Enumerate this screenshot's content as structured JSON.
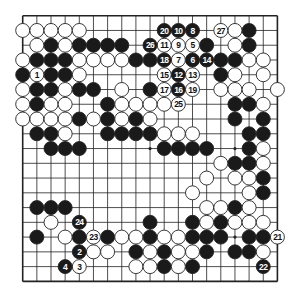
{
  "diagram": {
    "type": "go-board",
    "size": 19,
    "colors": {
      "black": "#1a1a1a",
      "white": "#ffffff",
      "line": "#222222",
      "background": "#ffffff"
    },
    "geometry": {
      "left": 22.7,
      "top": 15.7,
      "dx": 14.15,
      "dy": 14.76,
      "stone_r": 7.0
    },
    "star_points": [
      [
        3,
        3
      ],
      [
        3,
        9
      ],
      [
        3,
        15
      ],
      [
        9,
        3
      ],
      [
        9,
        9
      ],
      [
        9,
        15
      ],
      [
        15,
        3
      ],
      [
        15,
        9
      ],
      [
        15,
        15
      ]
    ],
    "stones": {
      "black": [
        [
          1,
          16
        ],
        [
          2,
          2
        ],
        [
          2,
          4
        ],
        [
          2,
          5
        ],
        [
          2,
          6
        ],
        [
          2,
          7
        ],
        [
          2,
          13
        ],
        [
          2,
          16
        ],
        [
          3,
          1
        ],
        [
          3,
          2
        ],
        [
          3,
          3
        ],
        [
          3,
          8
        ],
        [
          3,
          9
        ],
        [
          3,
          14
        ],
        [
          3,
          15
        ],
        [
          4,
          0
        ],
        [
          4,
          2
        ],
        [
          4,
          3
        ],
        [
          4,
          14
        ],
        [
          5,
          1
        ],
        [
          5,
          2
        ],
        [
          5,
          4
        ],
        [
          5,
          5
        ],
        [
          5,
          9
        ],
        [
          6,
          1
        ],
        [
          6,
          6
        ],
        [
          6,
          15
        ],
        [
          6,
          16
        ],
        [
          7,
          4
        ],
        [
          7,
          6
        ],
        [
          7,
          8
        ],
        [
          7,
          15
        ],
        [
          7,
          17
        ],
        [
          8,
          1
        ],
        [
          8,
          2
        ],
        [
          8,
          6
        ],
        [
          8,
          7
        ],
        [
          8,
          8
        ],
        [
          8,
          9
        ],
        [
          8,
          16
        ],
        [
          8,
          17
        ],
        [
          9,
          2
        ],
        [
          9,
          3
        ],
        [
          9,
          4
        ],
        [
          9,
          10
        ],
        [
          9,
          11
        ],
        [
          9,
          12
        ],
        [
          9,
          13
        ],
        [
          9,
          16
        ],
        [
          10,
          15
        ],
        [
          10,
          16
        ],
        [
          11,
          17
        ],
        [
          12,
          17
        ],
        [
          13,
          1
        ],
        [
          13,
          2
        ],
        [
          13,
          3
        ],
        [
          13,
          15
        ],
        [
          14,
          9
        ],
        [
          14,
          12
        ],
        [
          14,
          14
        ],
        [
          15,
          1
        ],
        [
          15,
          4
        ],
        [
          15,
          6
        ],
        [
          15,
          9
        ],
        [
          15,
          12
        ],
        [
          15,
          13
        ],
        [
          15,
          14
        ],
        [
          15,
          16
        ],
        [
          15,
          17
        ],
        [
          16,
          8
        ],
        [
          16,
          10
        ],
        [
          16,
          13
        ],
        [
          16,
          15
        ],
        [
          16,
          16
        ],
        [
          17,
          10
        ],
        [
          17,
          12
        ]
      ],
      "white": [
        [
          1,
          0
        ],
        [
          1,
          1
        ],
        [
          1,
          2
        ],
        [
          1,
          3
        ],
        [
          1,
          4
        ],
        [
          1,
          15
        ],
        [
          2,
          1
        ],
        [
          2,
          3
        ],
        [
          2,
          15
        ],
        [
          3,
          0
        ],
        [
          3,
          4
        ],
        [
          3,
          5
        ],
        [
          3,
          6
        ],
        [
          3,
          7
        ],
        [
          3,
          16
        ],
        [
          3,
          17
        ],
        [
          4,
          4
        ],
        [
          4,
          15
        ],
        [
          4,
          17
        ],
        [
          5,
          0
        ],
        [
          5,
          3
        ],
        [
          5,
          7
        ],
        [
          5,
          14
        ],
        [
          5,
          15
        ],
        [
          5,
          16
        ],
        [
          5,
          18
        ],
        [
          6,
          0
        ],
        [
          6,
          2
        ],
        [
          6,
          3
        ],
        [
          6,
          7
        ],
        [
          6,
          8
        ],
        [
          6,
          9
        ],
        [
          6,
          10
        ],
        [
          6,
          17
        ],
        [
          7,
          0
        ],
        [
          7,
          1
        ],
        [
          7,
          2
        ],
        [
          7,
          3
        ],
        [
          7,
          5
        ],
        [
          7,
          7
        ],
        [
          7,
          9
        ],
        [
          8,
          3
        ],
        [
          8,
          10
        ],
        [
          8,
          11
        ],
        [
          8,
          12
        ],
        [
          9,
          17
        ],
        [
          10,
          14
        ],
        [
          10,
          17
        ],
        [
          11,
          13
        ],
        [
          11,
          15
        ],
        [
          11,
          16
        ],
        [
          12,
          12
        ],
        [
          12,
          16
        ],
        [
          13,
          13
        ],
        [
          13,
          14
        ],
        [
          13,
          16
        ],
        [
          14,
          2
        ],
        [
          14,
          13
        ],
        [
          14,
          15
        ],
        [
          14,
          16
        ],
        [
          14,
          17
        ],
        [
          15,
          3
        ],
        [
          15,
          7
        ],
        [
          15,
          8
        ],
        [
          15,
          10
        ],
        [
          15,
          11
        ],
        [
          16,
          5
        ],
        [
          16,
          6
        ],
        [
          16,
          9
        ],
        [
          16,
          11
        ],
        [
          16,
          12
        ],
        [
          16,
          17
        ],
        [
          17,
          8
        ],
        [
          17,
          9
        ],
        [
          17,
          11
        ]
      ]
    },
    "moves": [
      {
        "n": "1",
        "color": "white",
        "row": 4,
        "col": 1
      },
      {
        "n": "2",
        "color": "black",
        "row": 16,
        "col": 4
      },
      {
        "n": "3",
        "color": "white",
        "row": 17,
        "col": 4
      },
      {
        "n": "4",
        "color": "black",
        "row": 17,
        "col": 3
      },
      {
        "n": "5",
        "color": "white",
        "row": 2,
        "col": 12
      },
      {
        "n": "6",
        "color": "black",
        "row": 3,
        "col": 12
      },
      {
        "n": "7",
        "color": "white",
        "row": 3,
        "col": 11
      },
      {
        "n": "8",
        "color": "black",
        "row": 1,
        "col": 12
      },
      {
        "n": "9",
        "color": "white",
        "row": 2,
        "col": 11
      },
      {
        "n": "10",
        "color": "black",
        "row": 1,
        "col": 11
      },
      {
        "n": "11",
        "color": "white",
        "row": 2,
        "col": 10
      },
      {
        "n": "12",
        "color": "black",
        "row": 4,
        "col": 11
      },
      {
        "n": "13",
        "color": "white",
        "row": 4,
        "col": 12
      },
      {
        "n": "14",
        "color": "black",
        "row": 3,
        "col": 13
      },
      {
        "n": "15",
        "color": "white",
        "row": 4,
        "col": 10
      },
      {
        "n": "16",
        "color": "black",
        "row": 5,
        "col": 11
      },
      {
        "n": "17",
        "color": "white",
        "row": 5,
        "col": 10
      },
      {
        "n": "18",
        "color": "black",
        "row": 3,
        "col": 10
      },
      {
        "n": "19",
        "color": "white",
        "row": 5,
        "col": 12
      },
      {
        "n": "20",
        "color": "black",
        "row": 1,
        "col": 10
      },
      {
        "n": "21",
        "color": "white",
        "row": 15,
        "col": 18
      },
      {
        "n": "22",
        "color": "black",
        "row": 17,
        "col": 17
      },
      {
        "n": "23",
        "color": "white",
        "row": 15,
        "col": 5
      },
      {
        "n": "24",
        "color": "black",
        "row": 14,
        "col": 4
      },
      {
        "n": "25",
        "color": "white",
        "row": 6,
        "col": 11
      },
      {
        "n": "26",
        "color": "black",
        "row": 2,
        "col": 9
      },
      {
        "n": "27",
        "color": "white",
        "row": 1,
        "col": 14
      }
    ]
  }
}
